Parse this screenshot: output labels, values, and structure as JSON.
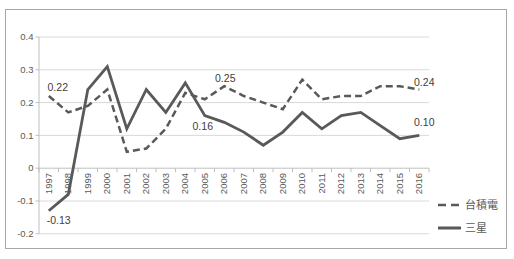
{
  "chart_data": {
    "type": "line",
    "title": "",
    "xlabel": "",
    "ylabel": "",
    "categories": [
      "1997",
      "1998",
      "1999",
      "2000",
      "2001",
      "2002",
      "2003",
      "2004",
      "2005",
      "2006",
      "2007",
      "2008",
      "2009",
      "2010",
      "2011",
      "2012",
      "2013",
      "2014",
      "2015",
      "2016"
    ],
    "series": [
      {
        "name": "台積電",
        "style": "dashed",
        "values": [
          0.22,
          0.17,
          0.19,
          0.24,
          0.05,
          0.06,
          0.12,
          0.23,
          0.21,
          0.25,
          0.22,
          0.2,
          0.18,
          0.27,
          0.21,
          0.22,
          0.22,
          0.25,
          0.25,
          0.24
        ]
      },
      {
        "name": "三星",
        "style": "solid",
        "values": [
          -0.13,
          -0.08,
          0.24,
          0.31,
          0.12,
          0.24,
          0.17,
          0.26,
          0.16,
          0.14,
          0.11,
          0.07,
          0.11,
          0.17,
          0.12,
          0.16,
          0.17,
          0.13,
          0.09,
          0.1
        ]
      }
    ],
    "ylim": [
      -0.2,
      0.4
    ],
    "yticks": [
      {
        "label": "0.4",
        "value": 0.4
      },
      {
        "label": "0.3",
        "value": 0.3
      },
      {
        "label": "0.2",
        "value": 0.2
      },
      {
        "label": "0.1",
        "value": 0.1
      },
      {
        "label": "0",
        "value": 0
      },
      {
        "label": "-0.1",
        "value": -0.1
      },
      {
        "label": "-0.2",
        "value": -0.2
      }
    ],
    "grid": true,
    "legend_position": "right-bottom",
    "annotations": [
      {
        "series": 0,
        "category": "1997",
        "text": "0.22",
        "dx": 9,
        "dy": -5
      },
      {
        "series": 0,
        "category": "2006",
        "text": "0.25",
        "dx": 1,
        "dy": -4
      },
      {
        "series": 0,
        "category": "2016",
        "text": "0.24",
        "dx": 5,
        "dy": -3
      },
      {
        "series": 1,
        "category": "1997",
        "text": "-0.13",
        "dx": 10,
        "dy": 13
      },
      {
        "series": 1,
        "category": "2005",
        "text": "0.16",
        "dx": -2,
        "dy": 14
      },
      {
        "series": 1,
        "category": "2016",
        "text": "0.10",
        "dx": 5,
        "dy": -9
      }
    ],
    "colors": {
      "line": "#595959",
      "grid": "#d9d9d9",
      "axis": "#bfbfbf",
      "tick_text": "#595959",
      "annotation_text": "#404040",
      "legend_text": "#595959",
      "frame_border": "#a8a8a8"
    }
  }
}
